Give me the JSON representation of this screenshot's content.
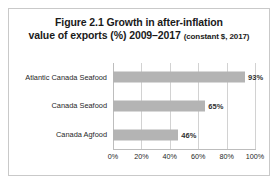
{
  "figure": {
    "title_line_1": "Figure 2.1 Growth in after-inflation",
    "title_line_2_main": "value of exports (%) 2009–2017",
    "title_line_2_note": "(constant $, 2017)"
  },
  "chart_data": {
    "type": "bar",
    "orientation": "horizontal",
    "title": "Figure 2.1 Growth in after-inflation value of exports (%) 2009–2017 (constant $, 2017)",
    "categories": [
      "Atlantic Canada Seafood",
      "Canada Seafood",
      "Canada Agfood"
    ],
    "values": [
      93,
      65,
      46
    ],
    "value_labels": [
      "93%",
      "65%",
      "46%"
    ],
    "xlabel": "",
    "ylabel": "",
    "xlim": [
      0,
      100
    ],
    "xticks": [
      0,
      20,
      40,
      60,
      80,
      100
    ],
    "xtick_labels": [
      "0%",
      "20%",
      "40%",
      "60%",
      "80%",
      "100%"
    ],
    "grid": "vertical",
    "legend": "none",
    "bar_color": "#b4b4b4",
    "gridline_color": "#d2d2d2",
    "frame_color": "#c9c9c9",
    "background": "#ffffff"
  }
}
